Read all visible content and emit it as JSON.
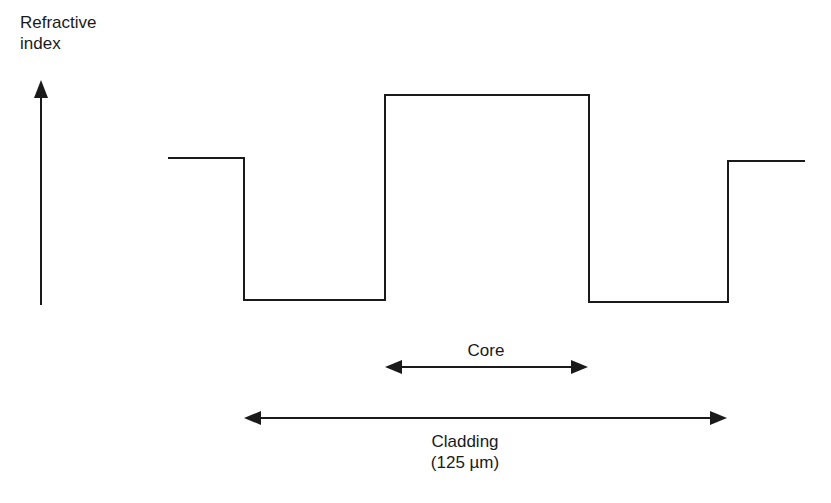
{
  "diagram": {
    "y_axis_label_line1": "Refractive",
    "y_axis_label_line2": "index",
    "core_label": "Core",
    "cladding_label": "Cladding",
    "cladding_size": "(125 µm)",
    "profile_type": "step-index",
    "line_color": "#1a1a1a"
  }
}
